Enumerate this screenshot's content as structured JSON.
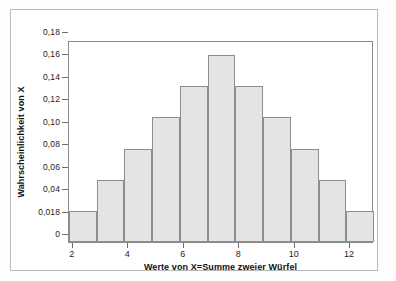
{
  "chart_data": {
    "type": "bar",
    "title": "",
    "subtitle": "",
    "xlabel": "Werte von X=Summe zweier Würfel",
    "ylabel": "Wahrscheinlichkeit von X",
    "categories": [
      "2",
      "3",
      "4",
      "5",
      "6",
      "7",
      "8",
      "9",
      "10",
      "11",
      "12"
    ],
    "values": [
      0.0278,
      0.0556,
      0.0833,
      0.1111,
      0.1389,
      0.1667,
      0.1389,
      0.1111,
      0.0833,
      0.0556,
      0.0278
    ],
    "xlim": [
      1.5,
      12.5
    ],
    "ylim": [
      0,
      0.18
    ],
    "grid": false,
    "legend": null,
    "x_ticks": [
      "2",
      "4",
      "6",
      "8",
      "10",
      "12"
    ],
    "x_tick_values": [
      2,
      4,
      6,
      8,
      10,
      12
    ],
    "y_ticks": [
      "0",
      "0,018",
      "0,04",
      "0,06",
      "0,08",
      "0,10",
      "0,12",
      "0,14",
      "0,16",
      "0,18"
    ],
    "y_tick_values": [
      0,
      0.02,
      0.04,
      0.06,
      0.08,
      0.1,
      0.12,
      0.14,
      0.16,
      0.18
    ],
    "bar_fill_color": "#e4e4e4",
    "bar_edge_color": "#8d8d8d",
    "axis_color": "#8a8a8a",
    "background_color": "#ffffff"
  }
}
